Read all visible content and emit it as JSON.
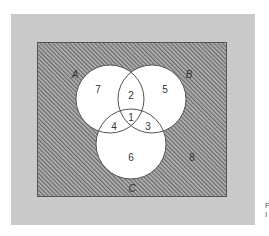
{
  "diagram": {
    "type": "venn",
    "universe_region_label": "8",
    "sets": [
      {
        "name": "A",
        "label": "A",
        "cx": 110,
        "cy": 99,
        "r": 34
      },
      {
        "name": "B",
        "label": "B",
        "cx": 152,
        "cy": 99,
        "r": 34
      },
      {
        "name": "C",
        "label": "C",
        "cx": 131,
        "cy": 144,
        "r": 35
      }
    ],
    "regions": [
      {
        "id": "A_only",
        "label": "7"
      },
      {
        "id": "A_and_B_only",
        "label": "2"
      },
      {
        "id": "B_only",
        "label": "5"
      },
      {
        "id": "A_and_B_and_C",
        "label": "1"
      },
      {
        "id": "A_and_C_only",
        "label": "4"
      },
      {
        "id": "B_and_C_only",
        "label": "3"
      },
      {
        "id": "C_only",
        "label": "6"
      },
      {
        "id": "outside_all",
        "label": "8"
      }
    ],
    "colors": {
      "panel": "#c9c9c9",
      "hatch_dark": "#6a6a6a",
      "hatch_light": "#b8b8b8",
      "circle_fill": "#ffffff",
      "stroke": "#555555"
    }
  },
  "caption": {
    "line1": "F",
    "line2": "I"
  }
}
